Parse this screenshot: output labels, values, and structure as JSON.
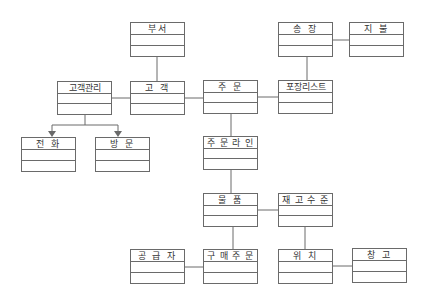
{
  "diagram": {
    "type": "class-diagram",
    "classes": [
      {
        "id": "dept",
        "name": "부서",
        "x": 130,
        "y": 22,
        "w": 55,
        "h": 35
      },
      {
        "id": "cust_mgmt",
        "name": "고객관리",
        "x": 57,
        "y": 81,
        "w": 55,
        "h": 34
      },
      {
        "id": "customer",
        "name": "고 객",
        "x": 130,
        "y": 81,
        "w": 55,
        "h": 34
      },
      {
        "id": "order",
        "name": "주 문",
        "x": 203,
        "y": 80,
        "w": 55,
        "h": 34
      },
      {
        "id": "packing_list",
        "name": "포장리스트",
        "x": 278,
        "y": 80,
        "w": 55,
        "h": 34
      },
      {
        "id": "invoice",
        "name": "송 장",
        "x": 278,
        "y": 22,
        "w": 55,
        "h": 35
      },
      {
        "id": "payment",
        "name": "지 불",
        "x": 349,
        "y": 22,
        "w": 55,
        "h": 35
      },
      {
        "id": "phone",
        "name": "전 화",
        "x": 21,
        "y": 137,
        "w": 55,
        "h": 35
      },
      {
        "id": "visit",
        "name": "방 문",
        "x": 95,
        "y": 137,
        "w": 55,
        "h": 35
      },
      {
        "id": "order_line",
        "name": "주 문 라 인",
        "x": 203,
        "y": 136,
        "w": 55,
        "h": 34
      },
      {
        "id": "item",
        "name": "물 품",
        "x": 203,
        "y": 193,
        "w": 55,
        "h": 34
      },
      {
        "id": "stock_level",
        "name": "재 고 수 준",
        "x": 278,
        "y": 193,
        "w": 55,
        "h": 34
      },
      {
        "id": "supplier",
        "name": "공 급 자",
        "x": 130,
        "y": 249,
        "w": 55,
        "h": 35
      },
      {
        "id": "purchase_order",
        "name": "구 매 주 문",
        "x": 203,
        "y": 249,
        "w": 55,
        "h": 35
      },
      {
        "id": "location",
        "name": "위 치",
        "x": 278,
        "y": 249,
        "w": 55,
        "h": 35
      },
      {
        "id": "warehouse",
        "name": "창 고",
        "x": 352,
        "y": 248,
        "w": 55,
        "h": 35
      }
    ],
    "associations": [
      [
        "dept",
        "customer"
      ],
      [
        "cust_mgmt",
        "customer"
      ],
      [
        "customer",
        "order"
      ],
      [
        "order",
        "packing_list"
      ],
      [
        "packing_list",
        "invoice"
      ],
      [
        "invoice",
        "payment"
      ],
      [
        "order",
        "order_line"
      ],
      [
        "order_line",
        "item"
      ],
      [
        "item",
        "stock_level"
      ],
      [
        "item",
        "purchase_order"
      ],
      [
        "supplier",
        "purchase_order"
      ],
      [
        "stock_level",
        "location"
      ],
      [
        "location",
        "warehouse"
      ]
    ],
    "generalizations": [
      {
        "parent": "cust_mgmt",
        "children": [
          "phone",
          "visit"
        ]
      }
    ],
    "line_color": "#6a6a6a"
  }
}
